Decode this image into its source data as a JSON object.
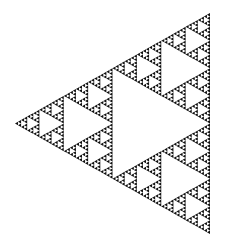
{
  "figure": {
    "title": "Sierpinski triangle",
    "depth": 6,
    "vertices": {
      "left": [
        15,
        123.5
      ],
      "top": [
        210,
        13
      ],
      "bottom": [
        210,
        234
      ]
    },
    "colors": {
      "fill": "#111111",
      "background": "#ffffff"
    }
  }
}
